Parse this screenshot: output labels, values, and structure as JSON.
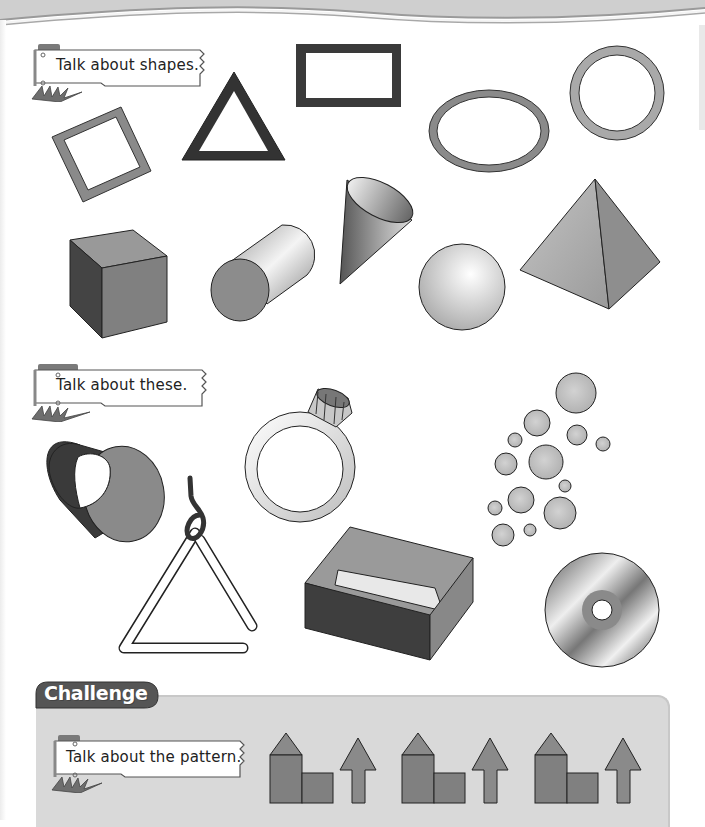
{
  "page": {
    "header_band_colors": {
      "band": "#cfcfcf",
      "stripe_light": "#f2f2f2",
      "stripe_dark": "#9a9a9a"
    }
  },
  "section1": {
    "prompt": "Talk about shapes.",
    "flat_shapes": [
      "square",
      "triangle",
      "rectangle",
      "oval",
      "circle"
    ],
    "solid_shapes": [
      "cube",
      "cylinder",
      "cone",
      "sphere",
      "pyramid"
    ]
  },
  "section2": {
    "prompt": "Talk about these.",
    "objects": [
      "tube",
      "ring",
      "bubbles",
      "triangle-instrument",
      "box",
      "cd"
    ]
  },
  "challenge": {
    "title": "Challenge",
    "prompt": "Talk about the pattern.",
    "pattern_repeats": 3,
    "pattern_unit": [
      "house-with-roof",
      "square-block",
      "up-arrow"
    ]
  },
  "colors": {
    "shape_fill": "#8a8a8a",
    "shape_dark": "#3a3a3a",
    "outline": "#222222",
    "panel": "#d9d9d9",
    "challenge_tab": "#555555"
  }
}
